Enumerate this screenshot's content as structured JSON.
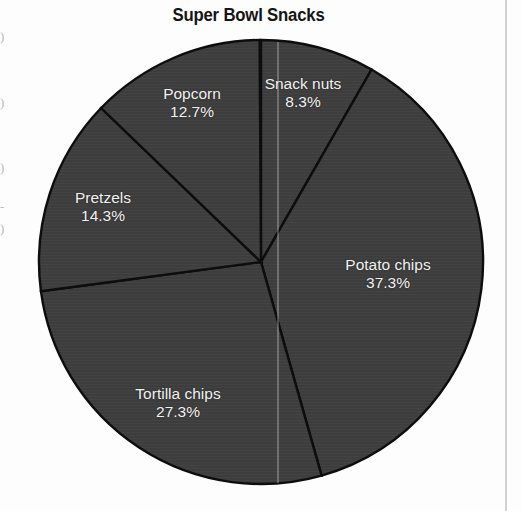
{
  "chart_data": {
    "type": "pie",
    "title": "Super Bowl Snacks",
    "xlabel": "",
    "ylabel": "",
    "legend": "none",
    "grid": false,
    "units": "percent",
    "categories": [
      "Snack nuts",
      "Potato chips",
      "Tortilla chips",
      "Pretzels",
      "Popcorn"
    ],
    "values": [
      8.3,
      37.3,
      27.3,
      14.3,
      12.7
    ],
    "slices": [
      {
        "label": "Snack nuts",
        "value": 8.3,
        "value_text": "8.3%",
        "start_angle_deg": 0,
        "sweep_deg": 29.88,
        "label_x": 303,
        "label_y": 93,
        "fill": "#3d3d3d"
      },
      {
        "label": "Potato chips",
        "value": 37.3,
        "value_text": "37.3%",
        "start_angle_deg": 29.88,
        "sweep_deg": 134.28,
        "label_x": 388,
        "label_y": 274,
        "fill": "#3d3d3d"
      },
      {
        "label": "Tortilla chips",
        "value": 27.3,
        "value_text": "27.3%",
        "start_angle_deg": 164.16,
        "sweep_deg": 98.28,
        "label_x": 178,
        "label_y": 403,
        "fill": "#3d3d3d"
      },
      {
        "label": "Pretzels",
        "value": 14.3,
        "value_text": "14.3%",
        "start_angle_deg": 262.44,
        "sweep_deg": 51.48,
        "label_x": 103,
        "label_y": 207,
        "fill": "#3d3d3d"
      },
      {
        "label": "Popcorn",
        "value": 12.7,
        "value_text": "12.7%",
        "start_angle_deg": 313.92,
        "sweep_deg": 45.72,
        "label_x": 192,
        "label_y": 103,
        "fill": "#3d3d3d"
      }
    ],
    "geometry": {
      "center_x": 261,
      "center_y": 262,
      "radius": 222
    },
    "colors": {
      "slice_fill": "#3d3d3d",
      "slice_border": "#0d0d0d",
      "label_text": "#f2f2f2",
      "title_text": "#151515",
      "page_background": "#fdfdfd",
      "rule_line": "#bdbdbd"
    }
  },
  "page_artifacts": {
    "right_rule_label": "column-rule",
    "fold_label": "scan-fold-line",
    "left_margin_fragments": [
      {
        "text": ")",
        "top": 30
      },
      {
        "text": ")",
        "top": 96
      },
      {
        "text": ")",
        "top": 161
      },
      {
        "text": "-",
        "top": 200
      },
      {
        "text": ")",
        "top": 222
      }
    ]
  }
}
